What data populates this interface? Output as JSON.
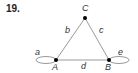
{
  "problem_number": "19.",
  "graph": {
    "vertices": [
      {
        "id": "A",
        "label": "A",
        "x": 56,
        "y": 60
      },
      {
        "id": "B",
        "label": "B",
        "x": 109,
        "y": 60
      },
      {
        "id": "C",
        "label": "C",
        "x": 85,
        "y": 18
      }
    ],
    "edges": [
      {
        "id": "a",
        "label": "a",
        "from": "A",
        "to": "A",
        "type": "loop"
      },
      {
        "id": "b",
        "label": "b",
        "from": "A",
        "to": "C"
      },
      {
        "id": "c",
        "label": "c",
        "from": "C",
        "to": "B"
      },
      {
        "id": "d",
        "label": "d",
        "from": "A",
        "to": "B"
      },
      {
        "id": "e",
        "label": "e",
        "from": "B",
        "to": "B",
        "type": "loop"
      }
    ]
  },
  "colors": {
    "edge": "#999999",
    "vertex": "#000000"
  }
}
